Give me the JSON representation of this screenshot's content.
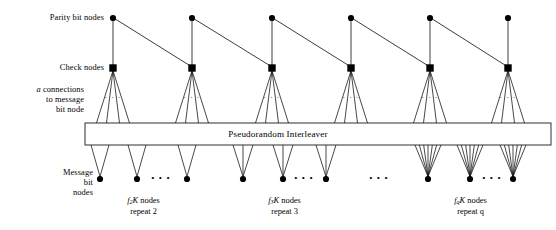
{
  "figure": {
    "type": "diagram",
    "width": 556,
    "height": 230,
    "background_color": "#ffffff",
    "stroke_color": "#1a1a1a",
    "node_fill": "#000000"
  },
  "labels": {
    "parity_bit_nodes": "Parity bit nodes",
    "check_nodes": "Check nodes",
    "a_connections_line1": "a",
    "a_connections_line1_rest": " connections",
    "a_connections_line2": "to message",
    "a_connections_line3": "bit node",
    "message_bit_nodes_line1": "Message",
    "message_bit_nodes_line2": "bit",
    "message_bit_nodes_line3": "nodes",
    "interleaver": "Pseudorandom Interleaver",
    "ellipsis": "• • •"
  },
  "groups": [
    {
      "id": "repeat-2",
      "count_label_prefix": "f",
      "count_label_sub": "2",
      "count_label_suffix": "K nodes",
      "repeat_label": "repeat 2",
      "repeat_degree": 2,
      "node_x": [
        100,
        137,
        187
      ],
      "inner_ellipsis_x": [
        161
      ]
    },
    {
      "id": "repeat-3",
      "count_label_prefix": "f",
      "count_label_sub": "3",
      "count_label_suffix": "K nodes",
      "repeat_label": "repeat 3",
      "repeat_degree": 3,
      "node_x": [
        243,
        283,
        326
      ],
      "inner_ellipsis_x": [
        304
      ]
    },
    {
      "id": "repeat-q",
      "count_label_prefix": "f",
      "count_label_sub": "q",
      "count_label_suffix": "K nodes",
      "repeat_label": "repeat q",
      "repeat_degree": 7,
      "node_x": [
        428,
        470,
        513
      ],
      "inner_ellipsis_x": [
        492
      ]
    }
  ],
  "group_gap_ellipsis_x": [
    379
  ],
  "rows": {
    "parity_y": 18,
    "check_y": 68,
    "interleaver_top_y": 123,
    "interleaver_bottom_y": 145,
    "message_y": 179
  },
  "node_columns_x": [
    113,
    192,
    272,
    351,
    430,
    508
  ],
  "interleaver_box": {
    "x": 85,
    "y": 123,
    "width": 466,
    "height": 22
  },
  "check_fanout_ellipsis": "· · ·",
  "counts": {
    "parity_nodes": 6,
    "check_nodes": 6,
    "message_nodes_drawn": 9
  }
}
